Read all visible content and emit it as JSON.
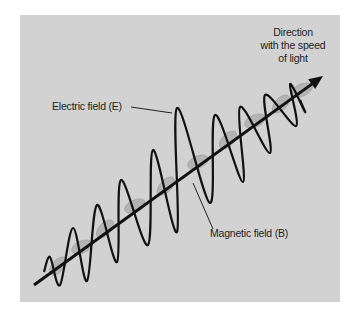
{
  "figure": {
    "background_color": "#d2d2d2",
    "page_color": "#ffffff",
    "wave_color": "#111111",
    "magnetic_color": "#b4b4b4",
    "axis": {
      "from": [
        34,
        285
      ],
      "to": [
        323,
        76
      ]
    },
    "electric_field_points": [
      [
        44,
        272
      ],
      [
        50,
        257
      ],
      [
        60,
        285
      ],
      [
        73,
        228
      ],
      [
        87,
        281
      ],
      [
        97,
        205
      ],
      [
        117,
        262
      ],
      [
        121,
        180
      ],
      [
        148,
        245
      ],
      [
        153,
        150
      ],
      [
        177,
        232
      ],
      [
        177,
        108
      ],
      [
        210,
        203
      ],
      [
        215,
        115
      ],
      [
        243,
        182
      ],
      [
        240,
        107
      ],
      [
        270,
        153
      ],
      [
        265,
        95
      ],
      [
        296,
        126
      ],
      [
        290,
        84
      ],
      [
        305,
        112
      ],
      [
        300,
        100
      ]
    ],
    "magnetic_blobs": [
      [
        58,
        266
      ],
      [
        82,
        247
      ],
      [
        105,
        229
      ],
      [
        135,
        206
      ],
      [
        166,
        186
      ],
      [
        198,
        162
      ],
      [
        228,
        140
      ],
      [
        255,
        121
      ],
      [
        281,
        104
      ],
      [
        302,
        90
      ]
    ]
  },
  "labels": {
    "direction": [
      "Direction",
      "with the speed",
      "of light"
    ],
    "electric": "Electric field (E)",
    "magnetic": "Magnetic field (B)"
  },
  "leaders": {
    "electric": {
      "from": [
        131,
        107
      ],
      "to": [
        172,
        113
      ]
    },
    "magnetic": {
      "from": [
        193,
        183
      ],
      "to": [
        213,
        229
      ]
    }
  }
}
